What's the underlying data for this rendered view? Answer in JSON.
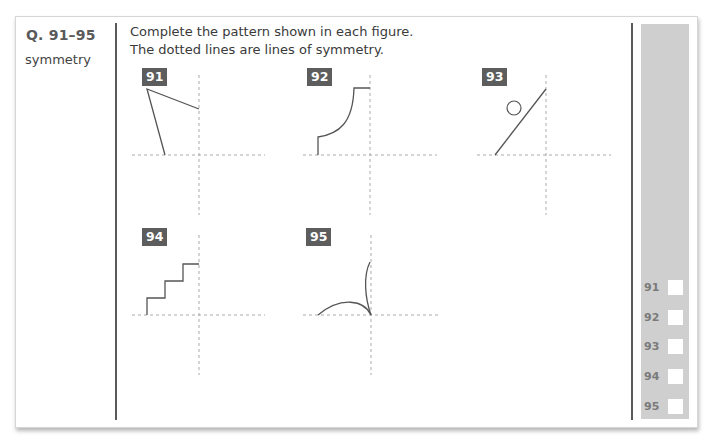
{
  "question": {
    "prefix": "Q.",
    "range": "91–95",
    "topic": "symmetry"
  },
  "instructions": {
    "line1": "Complete the pattern shown in each figure.",
    "line2": "The dotted lines are lines of symmetry."
  },
  "figures": [
    {
      "number": "91",
      "shape": "angled-lines"
    },
    {
      "number": "92",
      "shape": "curved-step"
    },
    {
      "number": "93",
      "shape": "diagonal-line-with-circle"
    },
    {
      "number": "94",
      "shape": "staircase"
    },
    {
      "number": "95",
      "shape": "curved-petals"
    }
  ],
  "answer_panel": {
    "items": [
      {
        "label": "91"
      },
      {
        "label": "92"
      },
      {
        "label": "93"
      },
      {
        "label": "94"
      },
      {
        "label": "95"
      }
    ]
  },
  "colors": {
    "badge": "#5d5d5d",
    "panel": "#cfcfcf",
    "divider": "#5a5a5a",
    "line": "#555555",
    "dotted": "#aaaaaa"
  }
}
